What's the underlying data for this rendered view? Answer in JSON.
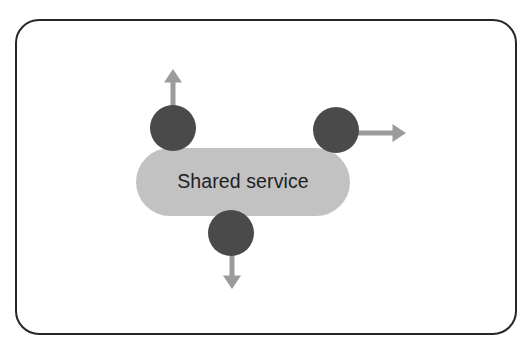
{
  "diagram": {
    "title_text": "Shared service",
    "frame": {
      "name": "slide-border",
      "x": 16,
      "y": 20,
      "width": 500,
      "height": 314,
      "radius": 23,
      "stroke_color": "#262626",
      "stroke_width": 2,
      "fill_color": "#ffffff"
    },
    "service_box": {
      "label": "Shared service",
      "x": 136,
      "y": 148,
      "width": 214,
      "height": 68,
      "radius": 34,
      "fill_color": "#c2c2c2",
      "text_color": "#1f1f1f",
      "text_x": 243,
      "text_y": 188
    },
    "nodes": [
      {
        "name": "node-top-left",
        "cx": 173,
        "cy": 128,
        "r": 23,
        "fill_color": "#4a4a4a"
      },
      {
        "name": "node-right",
        "cx": 336,
        "cy": 130,
        "r": 23,
        "fill_color": "#4a4a4a"
      },
      {
        "name": "node-bottom",
        "cx": 231,
        "cy": 233,
        "r": 23,
        "fill_color": "#4a4a4a"
      }
    ],
    "connectors": [
      {
        "name": "arrow-up",
        "direction": "up",
        "from_x": 173,
        "from_y": 135,
        "to_x": 173,
        "to_y": 69,
        "color": "#9b9b9b",
        "stroke_width": 5,
        "head_size": 9
      },
      {
        "name": "arrow-right",
        "direction": "right",
        "from_x": 330,
        "from_y": 133,
        "to_x": 406,
        "to_y": 133,
        "color": "#9b9b9b",
        "stroke_width": 5,
        "head_size": 9
      },
      {
        "name": "arrow-down",
        "direction": "down",
        "from_x": 232,
        "from_y": 228,
        "to_x": 232,
        "to_y": 289,
        "color": "#9b9b9b",
        "stroke_width": 5,
        "head_size": 9
      }
    ]
  }
}
